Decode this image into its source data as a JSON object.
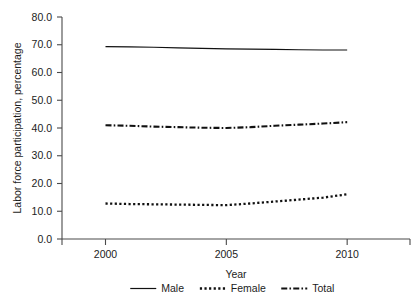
{
  "chart_data": {
    "type": "line",
    "title": "",
    "xlabel": "Year",
    "ylabel": "Labor force participation, percentage",
    "xlim": [
      1998.2,
      2012.6
    ],
    "ylim": [
      0.0,
      80.0
    ],
    "grid": false,
    "legend_position": "bottom",
    "x_tick_labels": [
      "2000",
      "2005",
      "2010"
    ],
    "x_ticks": [
      2000,
      2005,
      2010
    ],
    "y_tick_labels": [
      "0.0",
      "10.0",
      "20.0",
      "30.0",
      "40.0",
      "50.0",
      "60.0",
      "70.0",
      "80.0"
    ],
    "y_ticks": [
      0.0,
      10.0,
      20.0,
      30.0,
      40.0,
      50.0,
      60.0,
      70.0,
      80.0
    ],
    "x": [
      2000,
      2001,
      2002,
      2003,
      2004,
      2005,
      2006,
      2007,
      2008,
      2009,
      2010
    ],
    "series": [
      {
        "name": "Male",
        "style": "solid",
        "color": "#111111",
        "values": [
          69.3,
          69.2,
          69.1,
          68.9,
          68.7,
          68.5,
          68.4,
          68.3,
          68.2,
          68.1,
          68.1
        ]
      },
      {
        "name": "Female",
        "style": "dotted",
        "color": "#111111",
        "values": [
          12.8,
          12.6,
          12.5,
          12.4,
          12.3,
          12.2,
          12.8,
          13.5,
          14.2,
          14.9,
          16.1
        ]
      },
      {
        "name": "Total",
        "style": "dash-dot",
        "color": "#111111",
        "values": [
          41.0,
          40.8,
          40.5,
          40.3,
          40.1,
          40.0,
          40.3,
          40.8,
          41.2,
          41.6,
          42.1
        ]
      }
    ]
  },
  "legend": {
    "items": [
      {
        "label": "Male",
        "style": "solid"
      },
      {
        "label": "Female",
        "style": "dotted"
      },
      {
        "label": "Total",
        "style": "dash-dot"
      }
    ]
  },
  "axes": {
    "y_axis_title": "Labor force participation, percentage",
    "x_axis_title": "Year"
  }
}
